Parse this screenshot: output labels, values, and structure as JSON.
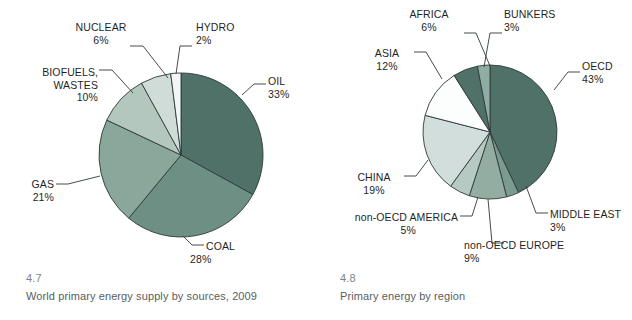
{
  "figures": [
    {
      "number": "4.7",
      "caption": "World primary energy supply by sources, 2009",
      "labels": {
        "oil": {
          "name": "OIL",
          "pct": "33%"
        },
        "coal": {
          "name": "COAL",
          "pct": "28%"
        },
        "gas": {
          "name": "GAS",
          "pct": "21%"
        },
        "biofuels_l1": {
          "name": "BIOFUELS,",
          "name2": "WASTES",
          "pct": "10%"
        },
        "nuclear": {
          "name": "NUCLEAR",
          "pct": "6%"
        },
        "hydro": {
          "name": "HYDRO",
          "pct": "2%"
        }
      }
    },
    {
      "number": "4.8",
      "caption": "Primary energy by region",
      "labels": {
        "oecd": {
          "name": "OECD",
          "pct": "43%"
        },
        "middle_east": {
          "name": "MIDDLE EAST",
          "pct": "3%"
        },
        "non_oecd_europe": {
          "name": "non-OECD EUROPE",
          "pct": "9%"
        },
        "non_oecd_america": {
          "name": "non-OECD AMERICA",
          "pct": "5%"
        },
        "china": {
          "name": "CHINA",
          "pct": "19%"
        },
        "asia": {
          "name": "ASIA",
          "pct": "12%"
        },
        "africa": {
          "name": "AFRICA",
          "pct": "6%"
        },
        "bunkers": {
          "name": "BUNKERS",
          "pct": "3%"
        }
      }
    }
  ],
  "chart_data": [
    {
      "type": "pie",
      "title": "World primary energy supply by sources, 2009",
      "figure_number": "4.7",
      "start_angle_deg": 0,
      "direction": "clockwise",
      "legend": "leader-line labels",
      "categories": [
        "OIL",
        "COAL",
        "GAS",
        "BIOFUELS, WASTES",
        "NUCLEAR",
        "HYDRO"
      ],
      "values": [
        33,
        28,
        21,
        10,
        6,
        2
      ],
      "unit": "percent",
      "colors": [
        "#4f7168",
        "#6d8f84",
        "#8aa79c",
        "#b3c7bf",
        "#cfdcd7",
        "#f2f6f5"
      ]
    },
    {
      "type": "pie",
      "title": "Primary energy by region",
      "figure_number": "4.8",
      "start_angle_deg": 0,
      "direction": "clockwise",
      "legend": "leader-line labels",
      "categories": [
        "OECD",
        "MIDDLE EAST",
        "non-OECD EUROPE",
        "non-OECD AMERICA",
        "CHINA",
        "ASIA",
        "AFRICA",
        "BUNKERS"
      ],
      "values": [
        43,
        3,
        9,
        5,
        19,
        12,
        6,
        3
      ],
      "unit": "percent",
      "colors": [
        "#4f7168",
        "#7b9b90",
        "#93ada3",
        "#b6cac3",
        "#d2dedb",
        "#fcfdfd",
        "#4f7168",
        "#8fada3"
      ]
    }
  ],
  "style": {
    "stroke": "#2f3a38",
    "text_color": "#1f1f1f",
    "caption_number_color": "#7c8386",
    "caption_text_color": "#58605f",
    "background": "#ffffff"
  }
}
